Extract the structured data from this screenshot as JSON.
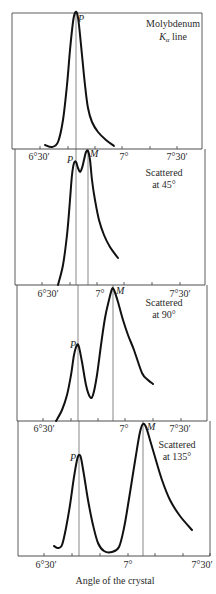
{
  "chart_data": {
    "type": "line",
    "xlabel": "Angle of the crystal",
    "ylabel": "",
    "grid": false,
    "panels": [
      {
        "id": "primary",
        "annotation": [
          "Molybdenum",
          "Kα line"
        ],
        "x_ticks": [
          "6°30′",
          "7°",
          "7°30′"
        ],
        "peaks": [
          {
            "label": "P",
            "angle": "6°41′",
            "relative_height": 1.0
          }
        ],
        "box": {
          "left": 12,
          "right": 202,
          "top": 13,
          "axis": 149
        },
        "tick_x": [
          40,
          68,
          95,
          122,
          150,
          177
        ],
        "label_x": {
          "6°30′": 40,
          "7°": 122,
          "7°30′": 177
        },
        "marker_lines": [
          {
            "label": "P",
            "x": 76
          }
        ],
        "curve": [
          [
            45,
            145
          ],
          [
            52,
            147
          ],
          [
            58,
            142
          ],
          [
            63,
            120
          ],
          [
            67,
            85
          ],
          [
            70,
            50
          ],
          [
            73,
            22
          ],
          [
            75,
            13
          ],
          [
            77,
            13
          ],
          [
            79,
            25
          ],
          [
            82,
            55
          ],
          [
            85,
            85
          ],
          [
            88,
            108
          ],
          [
            92,
            122
          ],
          [
            98,
            132
          ],
          [
            106,
            140
          ],
          [
            114,
            146
          ]
        ]
      },
      {
        "id": "scattered-45",
        "annotation": [
          "Scattered",
          "at 45°"
        ],
        "x_ticks": [
          "6°30′",
          "7°",
          "7°30′"
        ],
        "peaks": [
          {
            "label": "P",
            "angle": "6°41′",
            "relative_height": 0.85
          },
          {
            "label": "M",
            "angle": "6°46′",
            "relative_height": 0.95
          }
        ],
        "box": {
          "left": 15,
          "right": 205,
          "top": 149,
          "axis": 285
        },
        "tick_x": [
          42,
          70,
          97,
          124,
          152,
          180
        ],
        "label_x": {
          "6°30′": 45,
          "7°": 102,
          "7°30′": 180
        },
        "marker_lines": [
          {
            "label": "P",
            "x": 76
          },
          {
            "label": "M",
            "x": 88
          }
        ],
        "curve": [
          [
            58,
            285
          ],
          [
            63,
            265
          ],
          [
            67,
            235
          ],
          [
            70,
            200
          ],
          [
            72,
            175
          ],
          [
            74,
            163
          ],
          [
            76,
            162
          ],
          [
            78,
            168
          ],
          [
            80,
            172
          ],
          [
            82,
            168
          ],
          [
            84,
            160
          ],
          [
            86,
            152
          ],
          [
            88,
            151
          ],
          [
            90,
            160
          ],
          [
            92,
            180
          ],
          [
            95,
            200
          ],
          [
            99,
            220
          ],
          [
            104,
            235
          ],
          [
            110,
            247
          ],
          [
            118,
            258
          ]
        ]
      },
      {
        "id": "scattered-90",
        "annotation": [
          "Scattered",
          "at 90°"
        ],
        "x_ticks": [
          "6°30′",
          "7°",
          "7°30′"
        ],
        "peaks": [
          {
            "label": "P",
            "angle": "6°42′",
            "relative_height": 0.45
          },
          {
            "label": "M",
            "angle": "6°52′",
            "relative_height": 0.95
          }
        ],
        "box": {
          "left": 17,
          "right": 207,
          "top": 285,
          "axis": 421
        },
        "tick_x": [
          43,
          71,
          98,
          125,
          153,
          181
        ],
        "label_x": {
          "6°30′": 48,
          "7°": 99,
          "7°30′": 181
        },
        "marker_lines": [
          {
            "label": "P",
            "x": 78
          },
          {
            "label": "M",
            "x": 113
          }
        ],
        "curve": [
          [
            56,
            421
          ],
          [
            62,
            410
          ],
          [
            67,
            395
          ],
          [
            71,
            375
          ],
          [
            74,
            355
          ],
          [
            77,
            345
          ],
          [
            79,
            347
          ],
          [
            82,
            362
          ],
          [
            86,
            385
          ],
          [
            90,
            397
          ],
          [
            93,
            395
          ],
          [
            97,
            375
          ],
          [
            101,
            345
          ],
          [
            105,
            318
          ],
          [
            109,
            300
          ],
          [
            112,
            289
          ],
          [
            114,
            290
          ],
          [
            118,
            302
          ],
          [
            123,
            320
          ],
          [
            128,
            335
          ],
          [
            134,
            350
          ],
          [
            142,
            373
          ],
          [
            148,
            380
          ],
          [
            153,
            384
          ]
        ]
      },
      {
        "id": "scattered-135",
        "annotation": [
          "Scattered",
          "at 135°"
        ],
        "x_ticks": [
          "6°30′",
          "7°",
          "7°30′"
        ],
        "peaks": [
          {
            "label": "P",
            "angle": "6°41′",
            "relative_height": 0.68
          },
          {
            "label": "M",
            "angle": "7°03′",
            "relative_height": 0.95
          }
        ],
        "box": {
          "left": 18,
          "right": 210,
          "top": 421,
          "axis": 556
        },
        "tick_x": [
          44,
          72,
          100,
          128,
          155,
          183,
          210
        ],
        "label_x": {
          "6°30′": 44,
          "7°": 128,
          "7°30′": 202
        },
        "marker_lines": [
          {
            "label": "P",
            "x": 79
          },
          {
            "label": "M",
            "x": 143
          }
        ],
        "curve": [
          [
            54,
            546
          ],
          [
            58,
            548
          ],
          [
            62,
            545
          ],
          [
            66,
            528
          ],
          [
            70,
            505
          ],
          [
            74,
            477
          ],
          [
            77,
            460
          ],
          [
            79,
            455
          ],
          [
            81,
            458
          ],
          [
            84,
            475
          ],
          [
            88,
            500
          ],
          [
            93,
            525
          ],
          [
            98,
            543
          ],
          [
            104,
            551
          ],
          [
            112,
            552
          ],
          [
            119,
            547
          ],
          [
            124,
            528
          ],
          [
            128,
            505
          ],
          [
            132,
            480
          ],
          [
            136,
            455
          ],
          [
            140,
            432
          ],
          [
            143,
            424
          ],
          [
            146,
            427
          ],
          [
            150,
            440
          ],
          [
            155,
            457
          ],
          [
            162,
            480
          ],
          [
            170,
            500
          ],
          [
            180,
            516
          ],
          [
            192,
            530
          ]
        ]
      }
    ]
  },
  "figure": {
    "xlabel": "Angle of the crystal",
    "panels": [
      {
        "note1": "Molybdenum",
        "note2_main": "K",
        "note2_sub": "α",
        "note2_tail": " line",
        "peak_labels": [
          "P"
        ],
        "ticks": [
          "6°30′",
          "7°",
          "7°30′"
        ]
      },
      {
        "note1": "Scattered",
        "note2": "at 45°",
        "peak_labels": [
          "P",
          "M"
        ],
        "ticks": [
          "6°30′",
          "7°",
          "7°30′"
        ]
      },
      {
        "note1": "Scattered",
        "note2": "at 90°",
        "peak_labels": [
          "P",
          "M"
        ],
        "ticks": [
          "6°30′",
          "7°",
          "7°30′"
        ]
      },
      {
        "note1": "Scattered",
        "note2": "at 135°",
        "peak_labels": [
          "P",
          "M"
        ],
        "ticks": [
          "6°30′",
          "7°",
          "7°30′"
        ]
      }
    ]
  }
}
